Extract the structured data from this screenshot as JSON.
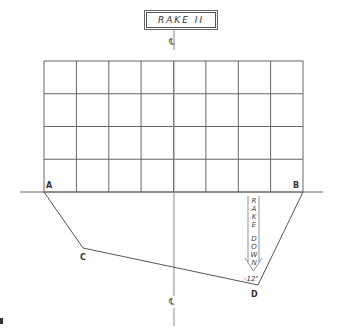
{
  "title": "RAKE II",
  "centerline_symbol_top": "℄",
  "centerline_symbol_bottom": "℄",
  "points": {
    "A": {
      "label": "A",
      "x": 44,
      "y": 192
    },
    "B": {
      "label": "B",
      "x": 303,
      "y": 192
    },
    "C": {
      "label": "C",
      "x": 83,
      "y": 248
    },
    "D": {
      "label": "D",
      "x": 258,
      "y": 285
    }
  },
  "grid": {
    "columns": 8,
    "rows": 4,
    "left": 44,
    "right": 303,
    "top": 61,
    "bottom": 192
  },
  "annotation": {
    "rake_word": "RAKE",
    "down_word": "DOWN",
    "dimension": "-12\""
  },
  "colors": {
    "line": "#555555",
    "text": "#333333",
    "background": "#ffffff"
  }
}
